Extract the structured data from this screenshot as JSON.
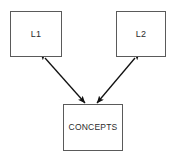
{
  "diagram": {
    "background_color": "#ffffff",
    "node_border_color": "#5a5a5a",
    "edge_color": "#111111",
    "text_color": "#2b2b2b",
    "nodes": [
      {
        "id": "l1",
        "label": "L1",
        "x": 10,
        "y": 11,
        "width": 52,
        "height": 46
      },
      {
        "id": "l2",
        "label": "L2",
        "x": 116,
        "y": 11,
        "width": 50,
        "height": 46
      },
      {
        "id": "concepts",
        "label": "CONCEPTS",
        "x": 63,
        "y": 104,
        "width": 60,
        "height": 47
      }
    ],
    "edges": [
      {
        "id": "l1-concepts",
        "from": "l1",
        "to": "concepts",
        "style": "double-headed-arrow",
        "x1": 45,
        "y1": 58,
        "x2": 85,
        "y2": 103
      },
      {
        "id": "l2-concepts",
        "from": "l2",
        "to": "concepts",
        "style": "double-headed-arrow",
        "x1": 135,
        "y1": 58,
        "x2": 97,
        "y2": 103
      }
    ]
  }
}
